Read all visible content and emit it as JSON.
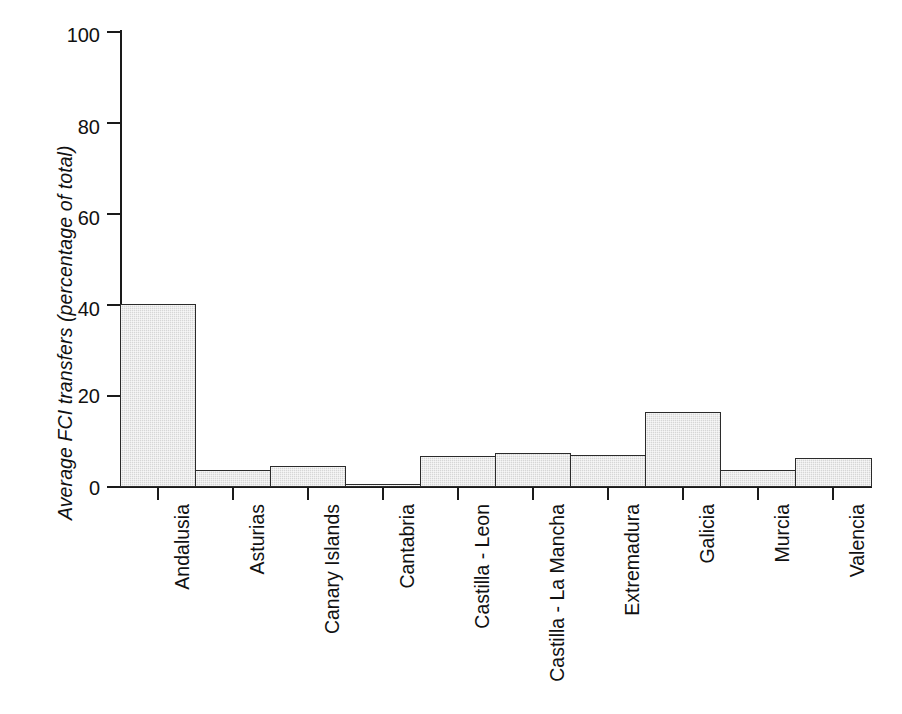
{
  "chart_data": {
    "type": "bar",
    "title": "",
    "subtitle": "",
    "xlabel": "",
    "ylabel": "Average FCI transfers (percentage of total)",
    "categories": [
      "Andalusia",
      "Asturias",
      "Canary Islands",
      "Cantabria",
      "Castilla - Leon",
      "Castilla - La Mancha",
      "Extremadura",
      "Galicia",
      "Murcia",
      "Valencia"
    ],
    "values": [
      40.0,
      3.8,
      4.5,
      0.7,
      6.9,
      7.4,
      7.0,
      16.5,
      3.8,
      6.3
    ],
    "ylim": [
      0,
      100
    ],
    "yticks": [
      0,
      20,
      40,
      60,
      80,
      100
    ],
    "ytick_labels": [
      "0",
      "20",
      "40",
      "60",
      "80",
      "100"
    ],
    "grid": false,
    "legend": null,
    "bar_style": {
      "fill_color": "#d6d6d6",
      "edge_color": "#2b2b2b",
      "gap": 0
    },
    "axis_color": "#1a1a1a",
    "background_color": "#ffffff"
  },
  "axes": {
    "y_title": "Average FCI transfers (percentage of total)",
    "tick_labels": {
      "t0": "0",
      "t20": "20",
      "t40": "40",
      "t60": "60",
      "t80": "80",
      "t100": "100"
    }
  },
  "x_labels": {
    "c0": "Andalusia",
    "c1": "Asturias",
    "c2": "Canary Islands",
    "c3": "Cantabria",
    "c4": "Castilla - Leon",
    "c5": "Castilla - La Mancha",
    "c6": "Extremadura",
    "c7": "Galicia",
    "c8": "Murcia",
    "c9": "Valencia"
  }
}
